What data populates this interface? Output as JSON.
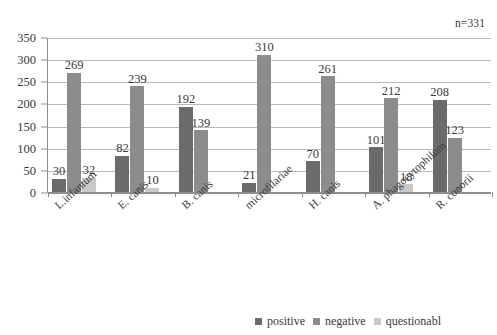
{
  "annotation": {
    "sample_size": "n=331"
  },
  "legend": {
    "position": "bottom-right",
    "items": [
      {
        "label": "positive",
        "color": "#6b6b6b"
      },
      {
        "label": "negative",
        "color": "#8c8c8c"
      },
      {
        "label": "questionabl",
        "color": "#c9c9c9"
      }
    ]
  },
  "chart_data": {
    "type": "bar",
    "title": "",
    "subtitle": "",
    "xlabel": "",
    "ylabel": "",
    "ylim": [
      0,
      350
    ],
    "yticks": [
      0,
      50,
      100,
      150,
      200,
      250,
      300,
      350
    ],
    "ytick_labels": [
      "0",
      "50",
      "100",
      "150",
      "200",
      "250",
      "300",
      "350"
    ],
    "grid": true,
    "legend_position": "bottom-right",
    "annotations": [
      "n=331"
    ],
    "categories": [
      "L.infantum",
      "E. canis",
      "B. canis",
      "microfilariae",
      "H. canis",
      "A. phagocytophilum",
      "R. conorii"
    ],
    "series": [
      {
        "name": "positive",
        "color": "#6b6b6b",
        "values": [
          30,
          82,
          192,
          21,
          70,
          101,
          208
        ],
        "labels": [
          "30",
          "82",
          "192",
          "21",
          "70",
          "101",
          "208"
        ]
      },
      {
        "name": "negative",
        "color": "#8c8c8c",
        "values": [
          269,
          239,
          139,
          310,
          261,
          212,
          123
        ],
        "labels": [
          "269",
          "239",
          "139",
          "310",
          "261",
          "212",
          "123"
        ]
      },
      {
        "name": "questionable",
        "color": "#c9c9c9",
        "values": [
          32,
          10,
          0,
          0,
          0,
          18,
          0
        ],
        "labels": [
          "32",
          "10",
          "",
          "",
          "",
          "18",
          ""
        ]
      }
    ]
  }
}
